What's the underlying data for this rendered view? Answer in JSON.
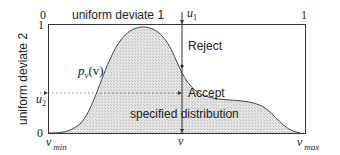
{
  "diagram": {
    "title_top": "uniform deviate 1",
    "axis_left_label": "uniform deviate 2",
    "top_tick_left": "0",
    "top_tick_right": "1",
    "left_tick_top": "1",
    "left_tick_bottom": "0",
    "u1_label": "u",
    "u1_sub": "1",
    "u2_label": "u",
    "u2_sub": "2",
    "curve_label_p": "p",
    "curve_label_sub": "v",
    "curve_label_arg": "(v)",
    "reject_label": "Reject",
    "accept_label": "Accept",
    "region_label": "specified distribution",
    "x_min_label": "v",
    "x_min_sub": "min",
    "x_v_label": "v",
    "x_max_label": "v",
    "x_max_sub": "max"
  },
  "colors": {
    "line": "#333333",
    "fill": "#d9d9d9"
  }
}
